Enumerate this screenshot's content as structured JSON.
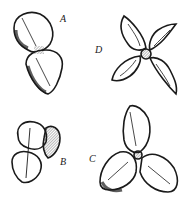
{
  "plate": {
    "description": "Engraved illustration of four seed/fruit forms",
    "ink_color": "#1a1a1a",
    "paper_color": "#ffffff"
  },
  "figures": [
    {
      "id": "A",
      "label": "A",
      "form": "two-lobed, stacked vertically"
    },
    {
      "id": "D",
      "label": "D",
      "form": "four-lobed cross / star"
    },
    {
      "id": "B",
      "label": "B",
      "form": "two-lobed, clustered"
    },
    {
      "id": "C",
      "label": "C",
      "form": "three-lobed trefoil"
    }
  ]
}
